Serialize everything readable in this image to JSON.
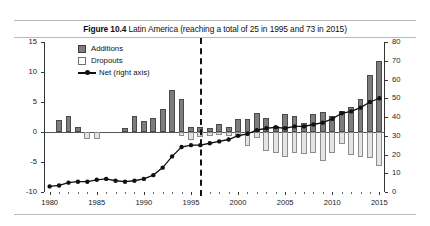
{
  "title": {
    "figure_label": "Figure 10.4",
    "text": " Latin America (reaching a total of 25 in 1995 and 73 in 2015)"
  },
  "legend": {
    "items": [
      {
        "key": "additions-swatch",
        "label": "Additions"
      },
      {
        "key": "dropouts-swatch",
        "label": "Dropouts"
      },
      {
        "key": "net-line-swatch",
        "label": "Net (right axis)"
      }
    ]
  },
  "colors": {
    "additions": "#7d7d7d",
    "dropouts": "#e4e4e4",
    "net_line": "#111111",
    "axis": "#333333",
    "marker_year_line": "#111111"
  },
  "annotations": {
    "marker_year": 1996
  },
  "chart_data": {
    "type": "bar",
    "title": "Figure 10.4 Latin America (reaching a total of 25 in 1995 and 73 in 2015)",
    "xlabel": "",
    "ylabel": "",
    "grid": false,
    "legend_position": "top-left",
    "xlim": [
      1979.4,
      2015.6
    ],
    "left_axis": {
      "label": "",
      "ylim": [
        -10,
        15
      ],
      "ticks": [
        -10,
        -5,
        0,
        5,
        10,
        15
      ]
    },
    "right_axis": {
      "label": "Net (right axis)",
      "ylim": [
        0,
        80
      ],
      "ticks": [
        0,
        10,
        20,
        30,
        40,
        50,
        60,
        70,
        80
      ]
    },
    "x": [
      1980,
      1981,
      1982,
      1983,
      1984,
      1985,
      1986,
      1987,
      1988,
      1989,
      1990,
      1991,
      1992,
      1993,
      1994,
      1995,
      1996,
      1997,
      1998,
      1999,
      2000,
      2001,
      2002,
      2003,
      2004,
      2005,
      2006,
      2007,
      2008,
      2009,
      2010,
      2011,
      2012,
      2013,
      2014,
      2015
    ],
    "xticks": [
      1980,
      1985,
      1990,
      1995,
      2000,
      2005,
      2010,
      2015
    ],
    "series": [
      {
        "name": "Additions",
        "axis": "left",
        "values": [
          0,
          2,
          2.7,
          0.8,
          0,
          0,
          0,
          0,
          0.7,
          2.7,
          1.8,
          2.3,
          3.8,
          7,
          5.5,
          0.8,
          0.9,
          0.6,
          1.3,
          0.8,
          2.2,
          2.2,
          3.2,
          2.4,
          1,
          3,
          2.7,
          1.5,
          3,
          3.4,
          2.6,
          3.5,
          4.2,
          5.5,
          9.5,
          11.8
        ]
      },
      {
        "name": "Dropouts",
        "axis": "left",
        "values": [
          0,
          0,
          0,
          0,
          -1.1,
          -1.2,
          0,
          0,
          0,
          0,
          0,
          0,
          0,
          0,
          -0.7,
          -1.3,
          -0.8,
          -0.7,
          -0.5,
          -0.6,
          -0.8,
          -2.3,
          -1,
          -3.2,
          -3.5,
          -4.2,
          -3.5,
          -3.7,
          -3.5,
          -4.8,
          -3.5,
          -2,
          -3.8,
          -4.2,
          -4.3,
          -5.6
        ]
      },
      {
        "name": "Net (right axis)",
        "axis": "right",
        "values": [
          3,
          3.5,
          5,
          5.5,
          5.5,
          6.5,
          7,
          6,
          5.5,
          6,
          7,
          9,
          13,
          19,
          24,
          25,
          25,
          26,
          27,
          28,
          30,
          31,
          33,
          34,
          34.5,
          34,
          35,
          35,
          36,
          37,
          39,
          42,
          43,
          45,
          48,
          50
        ]
      }
    ],
    "net_right_axis_values": [
      3,
      3.5,
      5,
      5.5,
      5.5,
      6.5,
      7,
      6,
      5.5,
      6,
      7,
      9,
      13,
      19,
      24,
      25,
      25,
      26,
      27,
      28,
      30,
      31,
      33,
      34,
      34.5,
      34,
      35,
      35,
      36,
      37,
      39,
      42,
      43,
      45,
      48,
      50
    ]
  }
}
